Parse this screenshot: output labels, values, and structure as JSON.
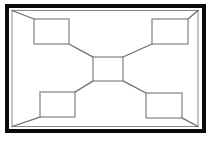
{
  "canvas": {
    "width": 216,
    "height": 142,
    "background": "#ffffff"
  },
  "diagram": {
    "colors": {
      "frame_outer": "#0a0a0a",
      "frame_inner": "#8a8a8a",
      "node_stroke": "#8a8a8a",
      "node_fill": "#ffffff",
      "link": "#6e6e6e",
      "background": "#ffffff"
    },
    "strokes": {
      "frame_outer_width": 4,
      "frame_inner_width": 1,
      "node_width": 1.3,
      "link_width": 1.3
    },
    "outer_frame": {
      "x": 7,
      "y": 6,
      "width": 197,
      "height": 125
    },
    "inner_frame": {
      "x": 12,
      "y": 10.5,
      "width": 186,
      "height": 116
    },
    "nodes": [
      {
        "id": "node-top-left",
        "label": "",
        "x": 34,
        "y": 19,
        "width": 35,
        "height": 25
      },
      {
        "id": "node-top-right",
        "label": "",
        "x": 152,
        "y": 19,
        "width": 36,
        "height": 25
      },
      {
        "id": "node-center",
        "label": "",
        "x": 93,
        "y": 57,
        "width": 30,
        "height": 24
      },
      {
        "id": "node-bottom-left",
        "label": "",
        "x": 40,
        "y": 92,
        "width": 35,
        "height": 25
      },
      {
        "id": "node-bottom-right",
        "label": "",
        "x": 146,
        "y": 93,
        "width": 36,
        "height": 25
      }
    ],
    "links": [
      {
        "id": "link-frame-to-top-left",
        "from": "frame-corner-top-left",
        "to": "node-top-left",
        "x1": 12,
        "y1": 10.5,
        "x2": 34,
        "y2": 19
      },
      {
        "id": "link-frame-to-top-right",
        "from": "frame-corner-top-right",
        "to": "node-top-right",
        "x1": 198,
        "y1": 10.5,
        "x2": 188,
        "y2": 19
      },
      {
        "id": "link-frame-to-bottom-left",
        "from": "frame-corner-bottom-left",
        "to": "node-bottom-left",
        "x1": 12,
        "y1": 126.5,
        "x2": 40,
        "y2": 117
      },
      {
        "id": "link-frame-to-bottom-right",
        "from": "frame-corner-bottom-right",
        "to": "node-bottom-right",
        "x1": 198,
        "y1": 126.5,
        "x2": 182,
        "y2": 118
      },
      {
        "id": "link-top-left-to-center",
        "from": "node-top-left",
        "to": "node-center",
        "x1": 69,
        "y1": 44,
        "x2": 93,
        "y2": 57
      },
      {
        "id": "link-top-right-to-center",
        "from": "node-top-right",
        "to": "node-center",
        "x1": 152,
        "y1": 44,
        "x2": 123,
        "y2": 57
      },
      {
        "id": "link-bottom-left-to-center",
        "from": "node-bottom-left",
        "to": "node-center",
        "x1": 75,
        "y1": 92,
        "x2": 93,
        "y2": 81
      },
      {
        "id": "link-bottom-right-to-center",
        "from": "node-bottom-right",
        "to": "node-center",
        "x1": 146,
        "y1": 93,
        "x2": 123,
        "y2": 81
      }
    ]
  }
}
